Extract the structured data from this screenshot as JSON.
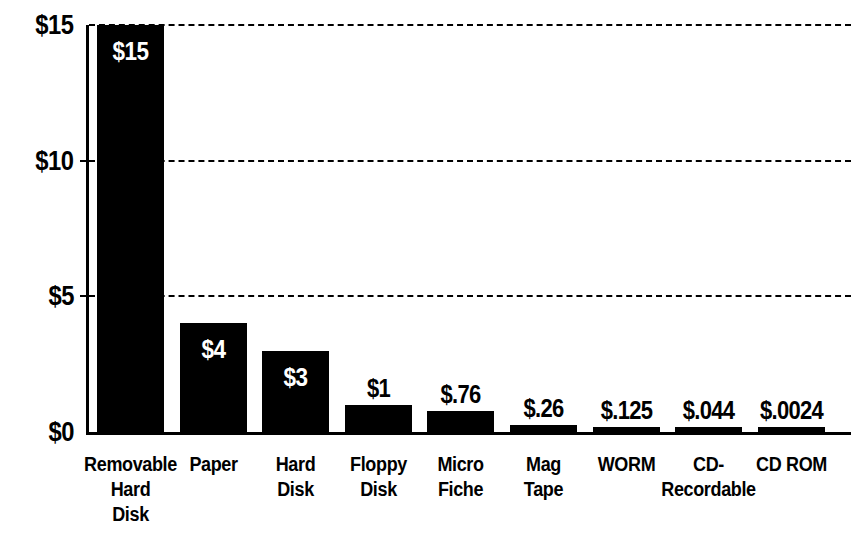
{
  "chart_data": {
    "type": "bar",
    "title": "",
    "xlabel": "",
    "ylabel": "",
    "ylim": [
      0,
      15
    ],
    "grid": true,
    "legend": "none",
    "orientation": "vertical",
    "bar_color": "#000000",
    "background_color": "#FFFFFF",
    "y_ticks": [
      {
        "value": 15,
        "label": "$15"
      },
      {
        "value": 10,
        "label": "$10"
      },
      {
        "value": 5,
        "label": "$5"
      },
      {
        "value": 0,
        "label": "$0"
      }
    ],
    "categories": [
      "Removable Hard Disk",
      "Paper",
      "Hard Disk",
      "Floppy Disk",
      "Micro Fiche",
      "Mag Tape",
      "WORM",
      "CD-Recordable",
      "CD ROM"
    ],
    "category_label_lines": [
      [
        "Removable",
        "Hard",
        "Disk"
      ],
      [
        "Paper"
      ],
      [
        "Hard",
        "Disk"
      ],
      [
        "Floppy",
        "Disk"
      ],
      [
        "Micro",
        "Fiche"
      ],
      [
        "Mag",
        "Tape"
      ],
      [
        "WORM"
      ],
      [
        "CD-",
        "Recordable"
      ],
      [
        "CD ROM"
      ]
    ],
    "values": [
      15,
      4,
      3,
      1,
      0.76,
      0.26,
      0.125,
      0.044,
      0.0024
    ],
    "value_labels": [
      "$15",
      "$4",
      "$3",
      "$1",
      "$.76",
      "$.26",
      "$.125",
      "$.044",
      "$.0024"
    ],
    "value_label_placement": [
      "inside",
      "inside",
      "inside",
      "above",
      "above",
      "above",
      "above",
      "above",
      "above"
    ]
  }
}
